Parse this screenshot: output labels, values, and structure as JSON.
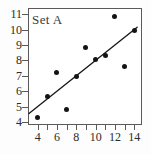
{
  "chart_data": {
    "type": "scatter",
    "title": "Set A",
    "xlabel": "",
    "ylabel": "",
    "xlim": [
      3.0,
      14.8
    ],
    "ylim": [
      3.8,
      11.4
    ],
    "grid": false,
    "legend": null,
    "x_ticks": [
      4,
      6,
      8,
      10,
      12,
      14
    ],
    "x_tick_labels": [
      "4",
      "6",
      "8",
      "10",
      "12",
      "14"
    ],
    "x_minor_ticks": [
      5,
      7,
      9,
      11,
      13
    ],
    "y_ticks": [
      4,
      5,
      6,
      7,
      8,
      9,
      10,
      11
    ],
    "y_tick_labels": [
      "4",
      "5",
      "6",
      "7",
      "8",
      "9",
      "10",
      "11"
    ],
    "points": [
      {
        "x": 4.0,
        "y": 4.26
      },
      {
        "x": 5.0,
        "y": 5.68
      },
      {
        "x": 6.0,
        "y": 7.24
      },
      {
        "x": 7.0,
        "y": 4.82
      },
      {
        "x": 8.0,
        "y": 6.95
      },
      {
        "x": 9.0,
        "y": 8.81
      },
      {
        "x": 10.0,
        "y": 8.04
      },
      {
        "x": 11.0,
        "y": 8.33
      },
      {
        "x": 12.0,
        "y": 10.84
      },
      {
        "x": 13.0,
        "y": 7.58
      },
      {
        "x": 14.0,
        "y": 9.96
      }
    ],
    "trend_line": {
      "label": "regression line",
      "slope": 0.5,
      "intercept": 3.0,
      "x_start": 3.1,
      "x_end": 14.3
    },
    "colors": {
      "point": "#141414",
      "line": "#1a1a1a",
      "frame": "#5a5a5a",
      "text": "#2b2b2b",
      "background": "#ffffff"
    }
  }
}
